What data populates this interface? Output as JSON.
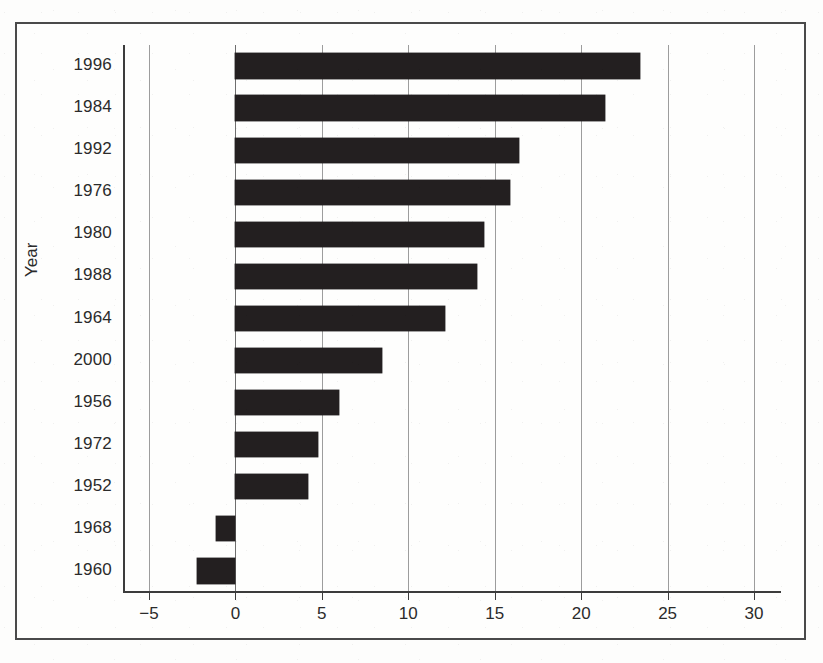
{
  "chart_data": {
    "type": "bar",
    "orientation": "horizontal",
    "title": "",
    "xlabel": "",
    "ylabel": "Year",
    "categories": [
      "1996",
      "1984",
      "1992",
      "1976",
      "1980",
      "1988",
      "1964",
      "2000",
      "1956",
      "1972",
      "1952",
      "1968",
      "1960"
    ],
    "values": [
      23.4,
      21.4,
      16.4,
      15.9,
      14.4,
      14.0,
      12.1,
      8.5,
      6.0,
      4.8,
      4.2,
      -1.1,
      -2.2
    ],
    "xlim": [
      -6.5,
      31.5
    ],
    "xticks": [
      -5,
      0,
      5,
      10,
      15,
      20,
      25,
      30
    ],
    "xtick_labels": [
      "−5",
      "0",
      "5",
      "10",
      "15",
      "20",
      "25",
      "30"
    ],
    "grid": "vertical-at-x-ticks",
    "legend": "none",
    "bar_color": "#231f20",
    "grid_color": "#9d9d9d",
    "axis_color": "#3c3c3c",
    "sorted": "descending-by-value"
  }
}
